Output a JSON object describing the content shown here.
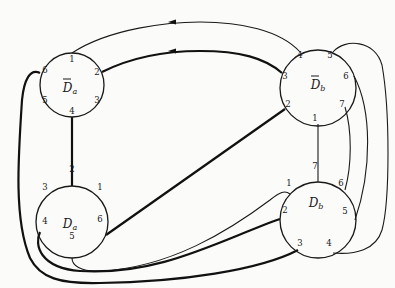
{
  "diagram": {
    "nodes": [
      {
        "id": "Dbar_a",
        "label_main": "D",
        "label_sub": "a",
        "bar": true,
        "ports": [
          "1",
          "2",
          "3",
          "4",
          "5",
          "6"
        ]
      },
      {
        "id": "Dbar_b",
        "label_main": "D",
        "label_sub": "b",
        "bar": true,
        "ports": [
          "1",
          "2",
          "3",
          "4",
          "5",
          "6",
          "7"
        ]
      },
      {
        "id": "D_a",
        "label_main": "D",
        "label_sub": "a",
        "bar": false,
        "ports": [
          "1",
          "2",
          "3",
          "4",
          "5",
          "6"
        ]
      },
      {
        "id": "D_b",
        "label_main": "D",
        "label_sub": "b",
        "bar": false,
        "ports": [
          "1",
          "2",
          "3",
          "4",
          "5",
          "6",
          "7"
        ]
      }
    ],
    "edges": [
      {
        "from": "Dbar_b.4",
        "to": "Dbar_a.1",
        "weight": "thin",
        "arrow": "toward Dbar_a"
      },
      {
        "from": "Dbar_b.3",
        "to": "Dbar_a.2",
        "weight": "thick",
        "arrow": "toward Dbar_a"
      },
      {
        "from": "Dbar_a.4",
        "to": "D_a.2",
        "weight": "thick"
      },
      {
        "from": "Dbar_a.6",
        "to": "D_b.3",
        "weight": "thick"
      },
      {
        "from": "Dbar_b.1",
        "to": "D_b.7",
        "weight": "thin"
      },
      {
        "from": "Dbar_b.2",
        "to": "D_a.6",
        "weight": "thick"
      },
      {
        "from": "Dbar_b.5",
        "to": "D_b.4",
        "weight": "thin"
      },
      {
        "from": "Dbar_b.6",
        "to": "D_b.5",
        "weight": "thin"
      },
      {
        "from": "Dbar_b.7",
        "to": "D_b.6",
        "weight": "thin"
      },
      {
        "from": "D_a.5",
        "to": "D_b.1",
        "weight": "thin"
      },
      {
        "from": "D_a.4",
        "to": "D_b.2",
        "weight": "thick"
      }
    ]
  }
}
